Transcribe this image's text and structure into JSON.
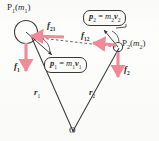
{
  "figure": {
    "type": "physics-diagram",
    "background_color": "#fdfdfb",
    "line_color": "#3a3a3a",
    "force_arrow_color": "#f2899a"
  },
  "particles": [
    {
      "id": "P1",
      "label_point": "P",
      "label_sub": "1",
      "label_mass_open": "(",
      "label_mass": "m",
      "label_mass_sub": "1",
      "label_mass_close": ")",
      "label_full": "P1(m1)"
    },
    {
      "id": "P2",
      "label_point": "P",
      "label_sub": "2",
      "label_mass_open": "(",
      "label_mass": "m",
      "label_mass_sub": "2",
      "label_mass_close": ")",
      "label_full": "P2(m2)"
    }
  ],
  "internal_forces": [
    {
      "id": "f21",
      "symbol": "f",
      "sub": "21",
      "description": "force on particle 1 due to particle 2, points right toward P2"
    },
    {
      "id": "f12",
      "symbol": "f",
      "sub": "12",
      "description": "force on particle 2 due to particle 1, points left toward P1"
    }
  ],
  "external_forces": [
    {
      "id": "f1",
      "symbol": "f",
      "sub": "1",
      "description": "external force on particle 1, points downward"
    },
    {
      "id": "f2",
      "symbol": "f",
      "sub": "2",
      "description": "external force on particle 2, points downward"
    }
  ],
  "momentum_labels": [
    {
      "id": "p2",
      "lhs_symbol": "p",
      "lhs_sub": "2",
      "equals": "=",
      "mass_symbol": "m",
      "mass_sub": "2",
      "vel_symbol": "v",
      "vel_sub": "2",
      "text_full": "p2 = m2v2"
    },
    {
      "id": "p1",
      "lhs_symbol": "p",
      "lhs_sub": "1",
      "equals": "=",
      "mass_symbol": "m",
      "mass_sub": "1",
      "vel_symbol": "v",
      "vel_sub": "1",
      "text_full": "p1 = m1v1"
    }
  ],
  "position_vectors": [
    {
      "id": "r1",
      "symbol": "r",
      "sub": "1",
      "description": "position vector from O to P1"
    },
    {
      "id": "r2",
      "symbol": "r",
      "sub": "2",
      "description": "position vector from O to P2"
    }
  ],
  "origin": {
    "label": "O",
    "description": "origin of coordinate system at bottom vertex"
  }
}
